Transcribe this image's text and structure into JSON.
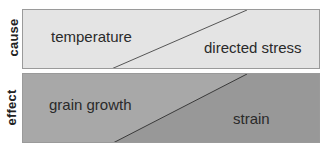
{
  "rows": [
    {
      "label": "cause",
      "left_text": "temperature",
      "right_text": "directed stress",
      "left_color": "#e4e4e4",
      "right_color": "#e4e4e4"
    },
    {
      "label": "effect",
      "left_text": "grain growth",
      "right_text": "strain",
      "left_color": "#a9a9a9",
      "right_color": "#999999"
    }
  ]
}
